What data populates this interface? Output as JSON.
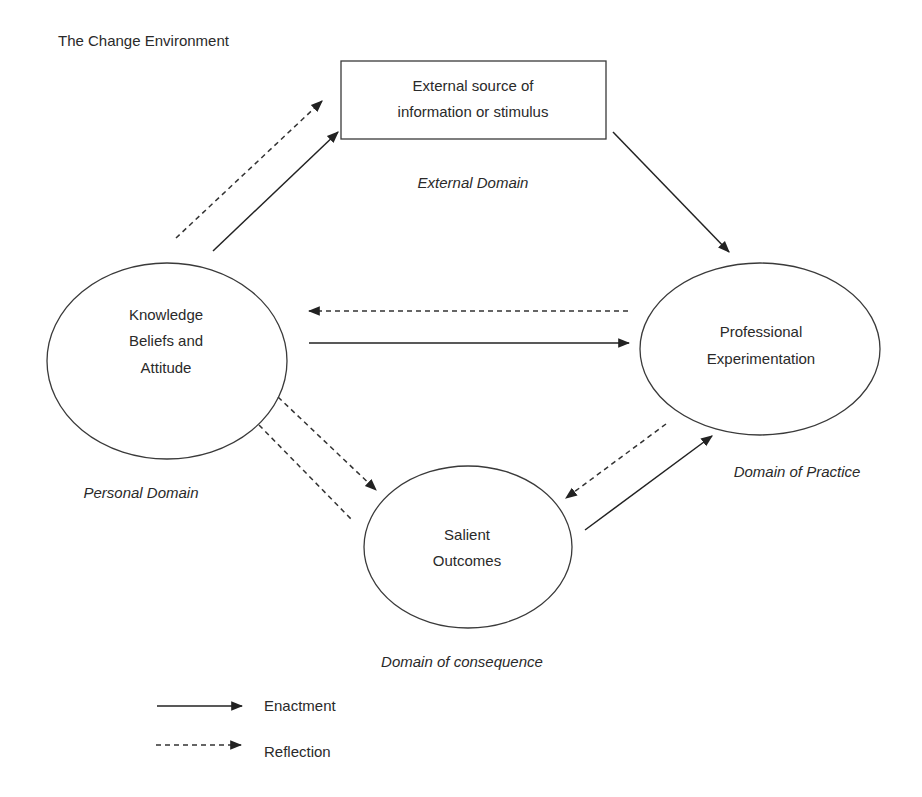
{
  "title": "The Change Environment",
  "colors": {
    "line": "#222222",
    "text": "#2a2a2a",
    "background": "#ffffff"
  },
  "nodes": {
    "external": {
      "shape": "rectangle",
      "lines": [
        "External source of",
        "information or stimulus"
      ],
      "domain": "External Domain"
    },
    "personal": {
      "shape": "ellipse",
      "lines": [
        "Knowledge",
        "Beliefs and",
        "Attitude"
      ],
      "domain": "Personal Domain"
    },
    "practice": {
      "shape": "ellipse",
      "lines": [
        "Professional",
        "Experimentation"
      ],
      "domain": "Domain of Practice"
    },
    "consequence": {
      "shape": "ellipse",
      "lines": [
        "Salient",
        "Outcomes"
      ],
      "domain": "Domain of consequence"
    }
  },
  "edges": [
    {
      "from": "personal",
      "to": "external",
      "type": "reflection"
    },
    {
      "from": "personal",
      "to": "external",
      "type": "enactment"
    },
    {
      "from": "external",
      "to": "practice",
      "type": "enactment"
    },
    {
      "from": "practice",
      "to": "personal",
      "type": "reflection"
    },
    {
      "from": "personal",
      "to": "practice",
      "type": "enactment"
    },
    {
      "from": "personal",
      "to": "consequence",
      "type": "reflection"
    },
    {
      "from": "consequence",
      "to": "personal",
      "type": "reflection",
      "arrowhead": false
    },
    {
      "from": "practice",
      "to": "consequence",
      "type": "reflection"
    },
    {
      "from": "consequence",
      "to": "practice",
      "type": "enactment"
    }
  ],
  "legend": {
    "items": [
      {
        "style": "solid",
        "label": "Enactment"
      },
      {
        "style": "dashed",
        "label": "Reflection"
      }
    ]
  }
}
